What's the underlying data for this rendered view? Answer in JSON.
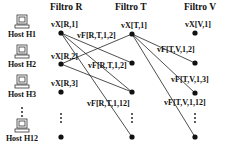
{
  "headers": {
    "filtro_r": "Filtro R",
    "filtro_t": "Filtro T",
    "filtro_v": "Filtro V"
  },
  "hosts": [
    {
      "name": "Host H1"
    },
    {
      "name": "Host H2"
    },
    {
      "name": "Host H3"
    },
    {
      "name": "Host H12"
    }
  ],
  "labels": {
    "vx_r1": "vX[R,1]",
    "vx_r2": "vX[R,2]",
    "vx_r3": "vX[R,3]",
    "vx_t1": "vX[T,1]",
    "vx_v1": "vX[V,1]",
    "vf_rt12_a": "vF[R,T,1,2]",
    "vf_rt12_b": "vF[R,T,1,2]",
    "vf_rt112": "vF[R,T,1,12]",
    "vf_tv12": "vF[T,V,1,2]",
    "vf_tv13": "vF[T,V,1,3]",
    "vf_tv112": "vF[T,V,1,12]"
  },
  "ellipsis": "⋮",
  "colors": {
    "ink": "#111111"
  }
}
